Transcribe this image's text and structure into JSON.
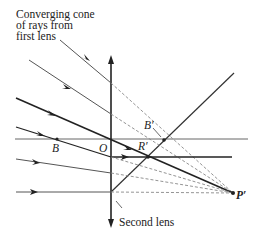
{
  "diagram": {
    "caption_top": [
      "Converging cone",
      "of rays from",
      "first lens"
    ],
    "caption_bottom": "Second lens",
    "points": {
      "B": "B",
      "O": "O",
      "B_prime": "B′",
      "R_prime": "R′",
      "P_prime": "P′"
    },
    "colors": {
      "line": "#222222",
      "gray_line": "#666666",
      "dashed": "#777777",
      "background": "#ffffff"
    }
  }
}
